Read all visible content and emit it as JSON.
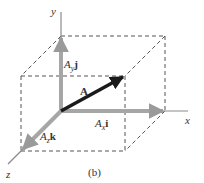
{
  "figure": {
    "caption": "(b)",
    "axes": {
      "x_label": "x",
      "y_label": "y",
      "z_label": "z"
    },
    "vectors": {
      "resultant": {
        "label": "A"
      },
      "x_component": {
        "coef": "A",
        "sub": "x",
        "unit": "i"
      },
      "y_component": {
        "coef": "A",
        "sub": "y",
        "unit": "j"
      },
      "z_component": {
        "coef": "A",
        "sub": "z",
        "unit": "k"
      }
    },
    "colors": {
      "axis": "#8a8a8a",
      "component": "#a6a6a6",
      "resultant": "#1a1a1a",
      "dashed_box": "#555555"
    }
  }
}
